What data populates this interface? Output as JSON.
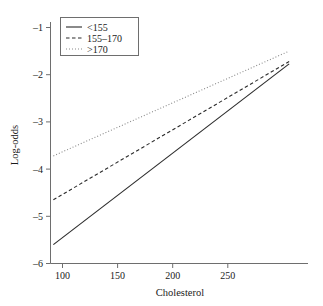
{
  "chart_data": {
    "type": "line",
    "title": "",
    "xlabel": "Cholesterol",
    "ylabel": "Log-odds",
    "xlim": [
      88,
      292
    ],
    "ylim": [
      -6.2,
      -0.85
    ],
    "xticks": [
      100,
      150,
      200,
      250
    ],
    "xtick_labels": [
      "100",
      "150",
      "200",
      "250"
    ],
    "yticks": [
      -1,
      -2,
      -3,
      -4,
      -5,
      -6
    ],
    "ytick_labels": [
      "–1",
      "–2",
      "–3",
      "–4",
      "–5",
      "–6"
    ],
    "grid": false,
    "legend_position": "upper left",
    "series": [
      {
        "name": "<155",
        "style": "solid",
        "color": "#2b2b2b",
        "x": [
          90,
          290
        ],
        "y": [
          -5.6,
          -1.77
        ]
      },
      {
        "name": "155–170",
        "style": "dashed",
        "color": "#2b2b2b",
        "x": [
          90,
          290
        ],
        "y": [
          -4.65,
          -1.72
        ]
      },
      {
        "name": ">170",
        "style": "dotted",
        "color": "#8a8a8a",
        "x": [
          90,
          290
        ],
        "y": [
          -3.72,
          -1.5
        ]
      }
    ]
  },
  "axes": {
    "x_title": "Cholesterol",
    "y_title": "Log-odds",
    "x_tick_labels": [
      "100",
      "150",
      "200",
      "250"
    ],
    "y_tick_labels": [
      "–1",
      "–2",
      "–3",
      "–4",
      "–5",
      "–6"
    ]
  },
  "legend": {
    "entries": [
      {
        "label": "<155",
        "style": "solid"
      },
      {
        "label": "155–170",
        "style": "dashed"
      },
      {
        "label": ">170",
        "style": "dotted"
      }
    ]
  },
  "colors": {
    "solid_line": "#2b2b2b",
    "dashed_line": "#2b2b2b",
    "dotted_line": "#8a8a8a",
    "axis": "#6e6e6e",
    "text": "#1a1a1a",
    "background": "#ffffff"
  }
}
